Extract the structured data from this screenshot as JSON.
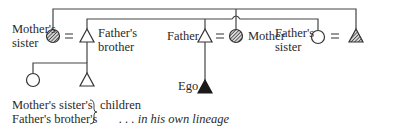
{
  "diagram": {
    "nodes": [
      {
        "id": "mothers-sister",
        "label_line1": "Mother's",
        "label_line2": "sister",
        "shape": "circle",
        "fill": "hatched"
      },
      {
        "id": "fathers-brother",
        "label_line1": "Father's",
        "label_line2": "brother",
        "shape": "triangle",
        "fill": "open"
      },
      {
        "id": "father",
        "label": "Father",
        "shape": "triangle",
        "fill": "open"
      },
      {
        "id": "mother",
        "label": "Mother",
        "shape": "circle",
        "fill": "hatched"
      },
      {
        "id": "fathers-sister",
        "label_line1": "Father's",
        "label_line2": "sister",
        "shape": "circle",
        "fill": "open"
      },
      {
        "id": "fathers-sisters-husband",
        "label": "",
        "shape": "triangle",
        "fill": "hatched"
      },
      {
        "id": "ego",
        "label": "Ego",
        "shape": "triangle",
        "fill": "solid"
      },
      {
        "id": "mothers-sisters-child",
        "shape": "circle",
        "fill": "open"
      },
      {
        "id": "fathers-brothers-child",
        "shape": "triangle",
        "fill": "open"
      }
    ],
    "marriage_symbol": "=",
    "caption": {
      "line1": "Mother's sister's",
      "line2": "Father's brother's",
      "brace": "}",
      "children": "children",
      "note": ". . . in his own lineage"
    },
    "colors": {
      "line": "#444444",
      "text": "#2a2a2a",
      "solid": "#1a1a1a",
      "hatch": "#555555"
    }
  }
}
